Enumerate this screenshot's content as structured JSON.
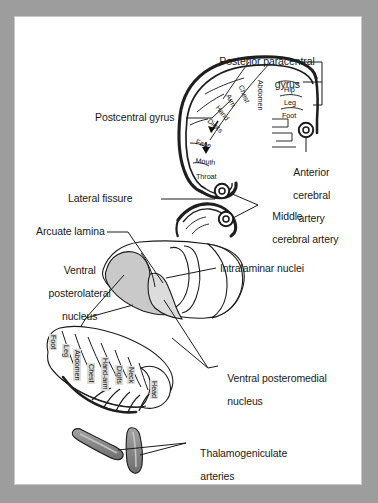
{
  "figure": {
    "page_background": "#ffffff",
    "frame_color": "#9d9d9d",
    "ink_color": "#1a1a1a",
    "vpl_fill": "#c9c9c9",
    "vpm_fill": "#dcdcdc",
    "artery_fill": "#8c8c8c"
  },
  "cortex": {
    "labels": {
      "posterior_paracentral_gyrus_line1": "Posterior paracentral",
      "posterior_paracentral_gyrus_line2": "gyrus",
      "postcentral_gyrus": "Postcentral gyrus",
      "lateral_fissure": "Lateral fissure",
      "anterior_cerebral_artery_line1": "Anterior",
      "anterior_cerebral_artery_line2": "cerebral",
      "anterior_cerebral_artery_line3": "artery",
      "middle_cerebral_artery_line1": "Middle",
      "middle_cerebral_artery_line2": "cerebral artery"
    },
    "homunculus_lateral": [
      {
        "label": "Chest",
        "x": 244,
        "y": 84,
        "rot": 68
      },
      {
        "label": "Arm",
        "x": 231,
        "y": 93,
        "rot": 62
      },
      {
        "label": "Hand",
        "x": 220,
        "y": 104,
        "rot": 52
      },
      {
        "label": "Digits",
        "x": 211,
        "y": 117,
        "rot": 42
      },
      {
        "label": "Face",
        "x": 197,
        "y": 138,
        "rot": 18
      },
      {
        "label": "Mouth",
        "x": 196,
        "y": 157,
        "rot": 6
      },
      {
        "label": "Throat",
        "x": 196,
        "y": 173,
        "rot": 0
      }
    ],
    "homunculus_medial": [
      {
        "label": "Abdomen",
        "x": 264,
        "y": 80,
        "rot": 90
      },
      {
        "label": "Hip",
        "x": 284,
        "y": 86,
        "rot": 0
      },
      {
        "label": "Leg",
        "x": 284,
        "y": 99,
        "rot": 0
      },
      {
        "label": "Foot",
        "x": 282,
        "y": 112,
        "rot": 0
      }
    ]
  },
  "thalamus": {
    "labels": {
      "arcuate_lamina": "Arcuate lamina",
      "ventral_posterolateral_line1": "Ventral",
      "ventral_posterolateral_line2": "posterolateral",
      "ventral_posterolateral_line3": "nucleus",
      "intralaminar_nuclei": "Intralaminar nuclei",
      "ventral_posteromedial_line1": "Ventral posteromedial",
      "ventral_posteromedial_line2": "nucleus",
      "thalamogeniculate_line1": "Thalamogeniculate",
      "thalamogeniculate_line2": "arteries"
    },
    "homunculus_map": [
      {
        "label": "Foot",
        "x": 57,
        "y": 334,
        "rot": 90
      },
      {
        "label": "Leg",
        "x": 70,
        "y": 344,
        "rot": 90
      },
      {
        "label": "Abdomen",
        "x": 81,
        "y": 349,
        "rot": 90
      },
      {
        "label": "Chest",
        "x": 95,
        "y": 363,
        "rot": 90
      },
      {
        "label": "Hand-arm",
        "x": 109,
        "y": 357,
        "rot": 90
      },
      {
        "label": "Digits",
        "x": 123,
        "y": 365,
        "rot": 90
      },
      {
        "label": "Neck",
        "x": 135,
        "y": 366,
        "rot": 90
      },
      {
        "label": "Head",
        "x": 158,
        "y": 380,
        "rot": 90
      }
    ]
  }
}
